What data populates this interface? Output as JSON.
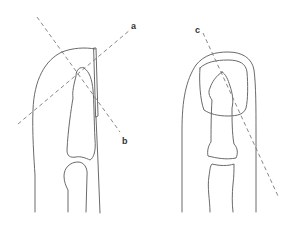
{
  "diagram": {
    "colors": {
      "line": "#6a6a6a",
      "dash": "#7a7a7a",
      "label": "#333333",
      "background": "#ffffff"
    },
    "left_view": {
      "label": "lateral view",
      "lines": [
        {
          "id": "a",
          "label": "a"
        },
        {
          "id": "b",
          "label": "b"
        }
      ]
    },
    "right_view": {
      "label": "dorsal view",
      "lines": [
        {
          "id": "c",
          "label": "c"
        }
      ]
    }
  }
}
